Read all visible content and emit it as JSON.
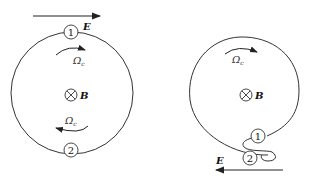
{
  "figure": {
    "left_panel": {
      "field_label": "E",
      "field_direction": "right",
      "magnetic_label": "B",
      "magnetic_symbol": "into-page",
      "omega_top_label": "Ω",
      "omega_top_sub": "c",
      "omega_bottom_label": "Ω",
      "omega_bottom_sub": "c",
      "point_1": "1",
      "point_2": "2"
    },
    "right_panel": {
      "field_label": "E",
      "field_direction": "left",
      "magnetic_label": "B",
      "magnetic_symbol": "into-page",
      "omega_label": "Ω",
      "omega_sub": "c",
      "point_1": "1",
      "point_2": "2"
    },
    "colors": {
      "stroke": "#222222",
      "background": "#ffffff"
    }
  }
}
